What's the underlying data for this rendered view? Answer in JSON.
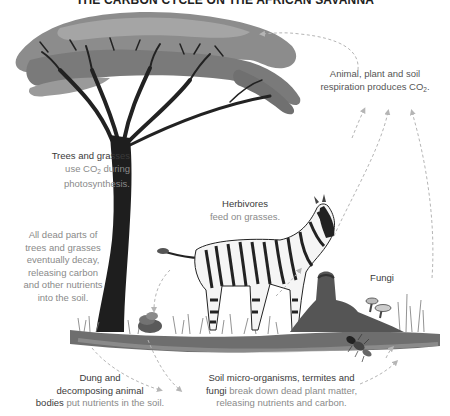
{
  "title": "THE CARBON CYCLE ON THE AFRICAN SAVANNA",
  "labels": {
    "respiration": {
      "line1": "Animal, plant and soil",
      "line2_prefix": "respiration produces CO",
      "line2_sub": "2",
      "line2_suffix": "."
    },
    "photosynthesis": {
      "strong": "Trees and grasses",
      "line2_prefix": "use CO",
      "line2_sub": "2",
      "line2_suffix": " during",
      "line3": "photosynthesis."
    },
    "decay": {
      "lines": [
        "All dead parts of",
        "trees and grasses",
        "eventually decay,",
        "releasing carbon",
        "and other nutrients",
        "into the soil."
      ]
    },
    "herbivores": {
      "strong": "Herbivores",
      "rest": "feed on grasses."
    },
    "fungi": {
      "text": "Fungi"
    },
    "dung": {
      "strong1": "Dung and",
      "strong2": "decomposing animal",
      "strong3": "bodies",
      "rest": " put nutrients in the soil."
    },
    "soil": {
      "strong1": "Soil micro-organisms, termites and",
      "strong2": "fungi",
      "rest1": " break down dead plant matter,",
      "rest2": "releasing nutrients and carbon."
    }
  },
  "illustration": {
    "elements": [
      "acacia-tree",
      "zebra",
      "dung-pile",
      "termite-mound",
      "fungi",
      "termite",
      "grass",
      "soil"
    ],
    "arrow_style": "dashed",
    "colors": {
      "arrow": "#b5b5b5",
      "foliage": "#8a8a8a",
      "trunk": "#1e1e1e",
      "soil": "#6e6e6e",
      "text_strong": "#3a3a3a",
      "text_light": "#8a8a8a"
    }
  }
}
